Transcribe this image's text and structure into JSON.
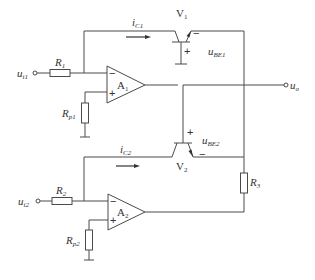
{
  "diagram": {
    "type": "circuit-schematic",
    "title": "",
    "colors": {
      "line": "#4a4a4a",
      "text": "#333333",
      "background": "#ffffff"
    },
    "inputs": [
      {
        "id": "ui1",
        "label": "u",
        "sub": "i1"
      },
      {
        "id": "ui2",
        "label": "u",
        "sub": "i2"
      }
    ],
    "output": {
      "id": "uo",
      "label": "u",
      "sub": "o"
    },
    "resistors": [
      {
        "id": "R1",
        "label": "R",
        "sub": "1"
      },
      {
        "id": "Rp1",
        "label": "R",
        "sub": "p1"
      },
      {
        "id": "R2",
        "label": "R",
        "sub": "2"
      },
      {
        "id": "Rp2",
        "label": "R",
        "sub": "p2"
      },
      {
        "id": "R3",
        "label": "R",
        "sub": "3"
      }
    ],
    "opamps": [
      {
        "id": "A1",
        "label": "A",
        "sub": "1",
        "minus": "−",
        "plus": "+"
      },
      {
        "id": "A2",
        "label": "A",
        "sub": "2",
        "minus": "−",
        "plus": "+"
      }
    ],
    "transistors": [
      {
        "id": "V1",
        "label": "V",
        "sub": "1"
      },
      {
        "id": "V2",
        "label": "V",
        "sub": "2"
      }
    ],
    "currents": [
      {
        "id": "iC1",
        "label": "i",
        "sub": "C1"
      },
      {
        "id": "iC2",
        "label": "i",
        "sub": "C2"
      }
    ],
    "voltages": [
      {
        "id": "uBE1",
        "label": "u",
        "sub": "BE1",
        "plus": "+",
        "minus": "−"
      },
      {
        "id": "uBE2",
        "label": "u",
        "sub": "BE2",
        "plus": "+",
        "minus": "−"
      }
    ]
  }
}
